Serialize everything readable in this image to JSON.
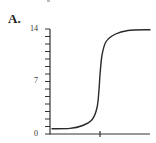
{
  "panel": {
    "label": "A."
  },
  "chart_data": {
    "type": "line",
    "title": "",
    "xlabel": "",
    "ylabel": "",
    "ylim": [
      0,
      14
    ],
    "yticks_labeled": [
      "0",
      "7",
      "14"
    ],
    "yticks_minor_step": 1,
    "xticks": [
      {
        "position": "equivalence point (midpoint of axis)",
        "label": ""
      }
    ],
    "grid": false,
    "legend": null,
    "series": [
      {
        "name": "pH",
        "x": [
          0.02,
          0.2,
          0.32,
          0.42,
          0.47,
          0.49,
          0.5,
          0.52,
          0.56,
          0.65,
          0.78,
          1.0
        ],
        "values": [
          0.7,
          0.75,
          1.1,
          1.9,
          3.5,
          5.9,
          7.9,
          10.5,
          12.3,
          13.3,
          13.8,
          13.9
        ]
      }
    ]
  },
  "axis": {
    "y_label_0": "0",
    "y_label_7": "7",
    "y_label_14": "14"
  },
  "colors": {
    "line": "#2a2a2a",
    "axis": "#333333"
  }
}
